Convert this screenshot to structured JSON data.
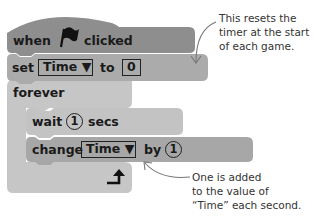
{
  "script": {
    "hat_block": {
      "label_before": "when",
      "icon": "green-flag-icon",
      "label_after": "clicked",
      "color": "#8e8e8e"
    },
    "set_block": {
      "label": "set",
      "variable": "Time ▼",
      "to_label": "to",
      "value": "0",
      "color": "#ababab"
    },
    "forever_block": {
      "label": "forever",
      "color": "#c6c6c6",
      "loop_icon": "loop-arrow-icon"
    },
    "wait_block": {
      "label": "wait",
      "value": "1",
      "unit": "secs",
      "color": "#c3c3c3"
    },
    "change_block": {
      "label": "change",
      "variable": "Time ▼",
      "by_label": "by",
      "value": "1",
      "color": "#a7a7a7"
    }
  },
  "annotations": {
    "top": "This resets the\ntimer at the start\nof each game.",
    "bottom": "One is added\nto the value of\n“Time” each second."
  },
  "colors": {
    "arrow": "#777777",
    "text": "#1a1a1a"
  }
}
